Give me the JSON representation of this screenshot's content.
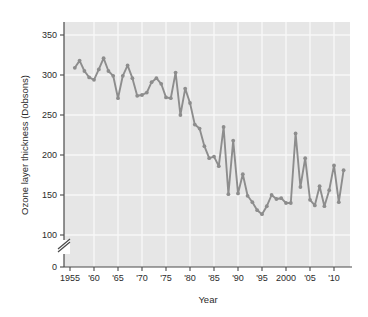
{
  "figure": {
    "background_color": "#ffffff",
    "plot_background_color": "#e6e6e6",
    "gridline_color": "#f7f7f7",
    "series_color": "#8d8d8d",
    "axis_color": "#4a4a4a",
    "text_color": "#2b2b2b"
  },
  "chart_data": {
    "type": "line",
    "title": "",
    "subtitle": "",
    "xlabel": "Year",
    "ylabel": "Ozone layer thickness (Dobsons)",
    "xlim": [
      1954,
      2013
    ],
    "ylim": [
      100,
      360
    ],
    "y_axis_break": true,
    "y_break_low": 0,
    "grid": true,
    "legend": "none",
    "y_ticks": [
      0,
      100,
      150,
      200,
      250,
      300,
      350
    ],
    "y_tick_labels": [
      "0",
      "100",
      "150",
      "200",
      "250",
      "300",
      "350"
    ],
    "x_ticks": [
      1955,
      1960,
      1965,
      1970,
      1975,
      1980,
      1985,
      1990,
      1995,
      2000,
      2005,
      2010
    ],
    "x_tick_labels": [
      "1955",
      "'60",
      "'65",
      "'70",
      "'75",
      "'80",
      "'85",
      "'90",
      "'95",
      "2000",
      "'05",
      "'10"
    ],
    "x": [
      1956,
      1957,
      1958,
      1959,
      1960,
      1961,
      1962,
      1963,
      1964,
      1965,
      1966,
      1967,
      1968,
      1969,
      1970,
      1971,
      1972,
      1973,
      1974,
      1975,
      1976,
      1977,
      1978,
      1979,
      1980,
      1981,
      1982,
      1983,
      1984,
      1985,
      1986,
      1987,
      1988,
      1989,
      1990,
      1991,
      1992,
      1993,
      1994,
      1995,
      1996,
      1997,
      1998,
      1999,
      2000,
      2001,
      2002,
      2003,
      2004,
      2005,
      2006,
      2007,
      2008,
      2009,
      2010,
      2011,
      2012
    ],
    "values": [
      309,
      318,
      305,
      297,
      294,
      307,
      321,
      305,
      299,
      271,
      299,
      312,
      296,
      274,
      275,
      278,
      291,
      296,
      289,
      272,
      271,
      303,
      250,
      283,
      265,
      238,
      233,
      211,
      196,
      198,
      186,
      235,
      151,
      218,
      152,
      176,
      149,
      141,
      131,
      126,
      136,
      150,
      145,
      146,
      140,
      140,
      227,
      160,
      196,
      144,
      137,
      161,
      136,
      156,
      187,
      141,
      181
    ],
    "series_name": "Ozone layer thickness",
    "marker": "circle",
    "annotations": []
  },
  "axes": {
    "y_title": "Ozone layer thickness (Dobsons)",
    "x_title": "Year"
  }
}
